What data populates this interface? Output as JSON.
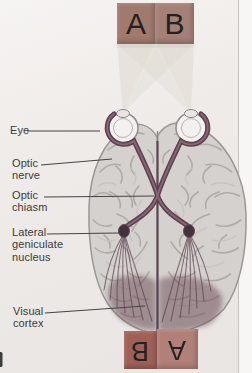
{
  "diagram": {
    "title_semantic": "Visual pathway from eyes to visual cortex (brain viewed from above)",
    "stimulus_top": {
      "left_letter": "A",
      "right_letter": "B"
    },
    "stimulus_bottom": {
      "left_letter": "B",
      "right_letter": "A"
    },
    "labels": {
      "eye": "Eye",
      "optic_nerve": "Optic nerve",
      "optic_chiasm": "Optic chiasm",
      "lateral_geniculate_nucleus": "Lateral geniculate nucleus",
      "visual_cortex": "Visual cortex"
    },
    "colors": {
      "pathway": "#5d4250",
      "pathway_highlight": "#8f6b7c",
      "lgn_fill": "#44313e",
      "visual_cortex_shade": "#6b4854",
      "beam": "#dbd5c9",
      "brain_fill": "#d4d1ce",
      "brain_outline": "#9b9794",
      "square_top_left": "#a1796d",
      "square_top_right": "#a48076",
      "square_bottom_left": "#9f6058",
      "square_bottom_right": "#b18078",
      "label_text": "#3b3b3b",
      "leader_line": "#454545"
    }
  }
}
